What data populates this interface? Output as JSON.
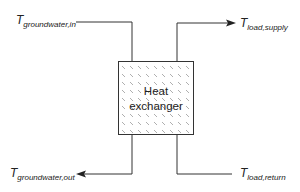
{
  "diagram": {
    "box": {
      "line1": "Heat",
      "line2": "exchanger"
    },
    "labels": {
      "groundwater_in": {
        "main": "T",
        "sub": "groundwater,in"
      },
      "load_supply": {
        "main": "T",
        "sub": "load,supply"
      },
      "groundwater_out": {
        "main": "T",
        "sub": "groundwater,out"
      },
      "load_return": {
        "main": "T",
        "sub": "load,return"
      }
    },
    "colors": {
      "line": "#333333",
      "hatch": "#999999"
    }
  }
}
